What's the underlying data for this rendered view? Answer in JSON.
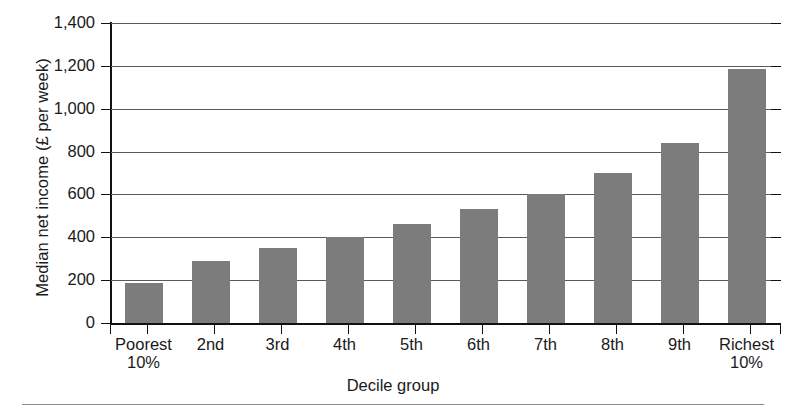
{
  "chart_data": {
    "type": "bar",
    "title": "",
    "xlabel": "Decile group",
    "ylabel": "Median net income (£ per week)",
    "categories": [
      "Poorest 10%",
      "2nd",
      "3rd",
      "4th",
      "5th",
      "6th",
      "7th",
      "8th",
      "9th",
      "Richest 10%"
    ],
    "category_lines": [
      [
        "Poorest",
        "10%"
      ],
      [
        "2nd",
        ""
      ],
      [
        "3rd",
        ""
      ],
      [
        "4th",
        ""
      ],
      [
        "5th",
        ""
      ],
      [
        "6th",
        ""
      ],
      [
        "7th",
        ""
      ],
      [
        "8th",
        ""
      ],
      [
        "9th",
        ""
      ],
      [
        "Richest",
        "10%"
      ]
    ],
    "values": [
      185,
      290,
      350,
      400,
      460,
      530,
      600,
      700,
      840,
      1185
    ],
    "ylim": [
      0,
      1400
    ],
    "ytick_values": [
      0,
      200,
      400,
      600,
      800,
      1000,
      1200,
      1400
    ],
    "ytick_labels": [
      "0",
      "200",
      "400",
      "600",
      "800",
      "1,000",
      "1,200",
      "1,400"
    ],
    "grid": "horizontal",
    "legend": "none",
    "bar_color": "#7c7c7c",
    "axis_color": "#111111",
    "gridline_color": "#5a5a5a"
  }
}
